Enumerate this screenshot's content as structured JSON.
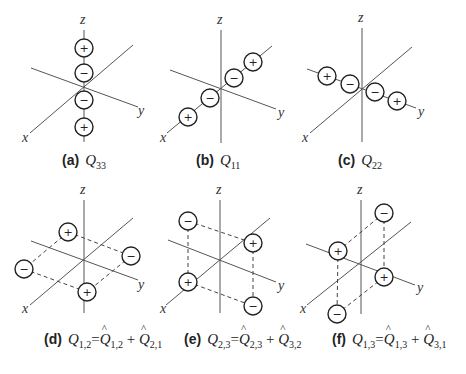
{
  "axis_labels": {
    "x": "x",
    "y": "y",
    "z": "z"
  },
  "panels": [
    {
      "id": "a",
      "tag": "(a)",
      "symbol": "Q",
      "sub": "33",
      "axes": {
        "z": [
          84,
          30,
          84,
          142
        ],
        "x": [
          30,
          133,
          133,
          45
        ],
        "y": [
          31,
          68,
          138,
          107
        ]
      },
      "labels": {
        "z": [
          80,
          24
        ],
        "x": [
          22,
          142
        ],
        "y": [
          138,
          115
        ]
      },
      "charges": [
        {
          "cx": 84,
          "cy": 48,
          "sign": "+"
        },
        {
          "cx": 84,
          "cy": 73,
          "sign": "−"
        },
        {
          "cx": 84,
          "cy": 100,
          "sign": "−"
        },
        {
          "cx": 84,
          "cy": 127,
          "sign": "+"
        }
      ],
      "dashes": []
    },
    {
      "id": "b",
      "tag": "(b)",
      "symbol": "Q",
      "sub": "11",
      "axes": {
        "z": [
          221,
          30,
          221,
          143
        ],
        "x": [
          167,
          133,
          272,
          46
        ],
        "y": [
          170,
          70,
          276,
          109
        ]
      },
      "labels": {
        "z": [
          217,
          24
        ],
        "x": [
          160,
          142
        ],
        "y": [
          278,
          117
        ]
      },
      "charges": [
        {
          "cx": 253,
          "cy": 62,
          "sign": "+"
        },
        {
          "cx": 234,
          "cy": 78,
          "sign": "−"
        },
        {
          "cx": 210,
          "cy": 98,
          "sign": "−"
        },
        {
          "cx": 188,
          "cy": 117,
          "sign": "+"
        }
      ],
      "dashes": []
    },
    {
      "id": "c",
      "tag": "(c)",
      "symbol": "Q",
      "sub": "22",
      "axes": {
        "z": [
          362,
          28,
          362,
          142
        ],
        "x": [
          310,
          133,
          412,
          47
        ],
        "y": [
          307,
          69,
          416,
          108
        ]
      },
      "labels": {
        "z": [
          358,
          22
        ],
        "x": [
          302,
          142
        ],
        "y": [
          418,
          116
        ]
      },
      "charges": [
        {
          "cx": 327,
          "cy": 76,
          "sign": "+"
        },
        {
          "cx": 350,
          "cy": 84,
          "sign": "−"
        },
        {
          "cx": 375,
          "cy": 92,
          "sign": "−"
        },
        {
          "cx": 397,
          "cy": 101,
          "sign": "+"
        }
      ],
      "dashes": []
    },
    {
      "id": "d",
      "tag": "(d)",
      "symbol": "Q",
      "sub": "1,2",
      "axes": {
        "z": [
          84,
          200,
          84,
          313
        ],
        "x": [
          30,
          305,
          133,
          218
        ],
        "y": [
          31,
          241,
          138,
          280
        ]
      },
      "labels": {
        "z": [
          80,
          194
        ],
        "x": [
          22,
          313
        ],
        "y": [
          138,
          289
        ]
      },
      "charges": [
        {
          "cx": 68,
          "cy": 232,
          "sign": "+"
        },
        {
          "cx": 131,
          "cy": 256,
          "sign": "−"
        },
        {
          "cx": 24,
          "cy": 269,
          "sign": "−"
        },
        {
          "cx": 87,
          "cy": 292,
          "sign": "+"
        }
      ],
      "dashes": [
        [
          68,
          232,
          131,
          256
        ],
        [
          68,
          232,
          24,
          269
        ],
        [
          24,
          269,
          87,
          292
        ],
        [
          131,
          256,
          87,
          292
        ]
      ]
    },
    {
      "id": "e",
      "tag": "(e)",
      "symbol": "Q",
      "sub": "2,3",
      "axes": {
        "z": [
          220,
          200,
          220,
          313
        ],
        "x": [
          166,
          305,
          270,
          218
        ],
        "y": [
          168,
          240,
          276,
          282
        ]
      },
      "labels": {
        "z": [
          216,
          194
        ],
        "x": [
          160,
          313
        ],
        "y": [
          278,
          290
        ]
      },
      "charges": [
        {
          "cx": 188,
          "cy": 221,
          "sign": "−"
        },
        {
          "cx": 253,
          "cy": 243,
          "sign": "+"
        },
        {
          "cx": 188,
          "cy": 282,
          "sign": "+"
        },
        {
          "cx": 253,
          "cy": 306,
          "sign": "−"
        }
      ],
      "dashes": [
        [
          188,
          221,
          253,
          243
        ],
        [
          188,
          221,
          188,
          282
        ],
        [
          253,
          243,
          253,
          306
        ],
        [
          188,
          282,
          253,
          306
        ]
      ]
    },
    {
      "id": "f",
      "tag": "(f)",
      "symbol": "Q",
      "sub": "1,3",
      "axes": {
        "z": [
          361,
          200,
          361,
          314
        ],
        "x": [
          307,
          305,
          411,
          222
        ],
        "y": [
          306,
          244,
          415,
          285
        ]
      },
      "labels": {
        "z": [
          357,
          194
        ],
        "x": [
          300,
          313
        ],
        "y": [
          417,
          292
        ]
      },
      "charges": [
        {
          "cx": 384,
          "cy": 213,
          "sign": "−"
        },
        {
          "cx": 338,
          "cy": 251,
          "sign": "+"
        },
        {
          "cx": 384,
          "cy": 277,
          "sign": "+"
        },
        {
          "cx": 337,
          "cy": 314,
          "sign": "−"
        }
      ],
      "dashes": [
        [
          384,
          213,
          338,
          251
        ],
        [
          384,
          213,
          384,
          277
        ],
        [
          338,
          251,
          337,
          314
        ],
        [
          384,
          277,
          337,
          314
        ]
      ]
    }
  ],
  "captions": {
    "a": {
      "tag": "(a)",
      "lhs": "Q",
      "lhs_sub": "33"
    },
    "b": {
      "tag": "(b)",
      "lhs": "Q",
      "lhs_sub": "11"
    },
    "c": {
      "tag": "(c)",
      "lhs": "Q",
      "lhs_sub": "22"
    },
    "d": {
      "tag": "(d)",
      "lhs": "Q",
      "lhs_sub": "1,2",
      "eq": "=",
      "t1": "Q",
      "t1_sub": "1,2",
      "plus": "+",
      "t2": "Q",
      "t2_sub": "2,1"
    },
    "e": {
      "tag": "(e)",
      "lhs": "Q",
      "lhs_sub": "2,3",
      "eq": "=",
      "t1": "Q",
      "t1_sub": "2,3",
      "plus": "+",
      "t2": "Q",
      "t2_sub": "3,2"
    },
    "f": {
      "tag": "(f)",
      "lhs": "Q",
      "lhs_sub": "1,3",
      "eq": "=",
      "t1": "Q",
      "t1_sub": "1,3",
      "plus": "+",
      "t2": "Q",
      "t2_sub": "3,1"
    }
  },
  "style": {
    "axis_color": "#555555",
    "charge_stroke": "#222222",
    "charge_radius": 9
  }
}
